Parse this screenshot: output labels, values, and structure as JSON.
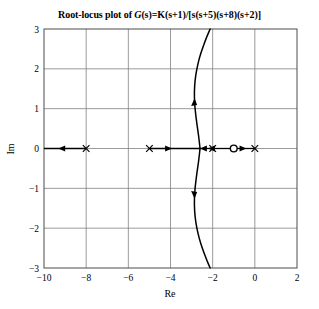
{
  "figure": {
    "title_prefix": "Root-locus plot of ",
    "title_expr_g": "G",
    "title_expr_s1": "(s)",
    "title_expr_eq": "=K",
    "title_expr_rest": "(s+1)/[s(s+5)(s+8)(s+2)]",
    "title_full": "Root-locus plot of G(s)=K(s+1)/[s(s+5)(s+8)(s+2)]"
  },
  "chart_data": {
    "type": "line",
    "title": "Root-locus plot of G(s)=K(s+1)/[s(s+5)(s+8)(s+2)]",
    "xlabel": "Re",
    "ylabel": "Im",
    "xlim": [
      -10,
      2
    ],
    "ylim": [
      -3,
      3
    ],
    "grid": true,
    "legend": "none",
    "xticks": [
      -10,
      -8,
      -6,
      -4,
      -2,
      0,
      2
    ],
    "xtick_labels": [
      "−10",
      "−8",
      "−6",
      "−4",
      "−2",
      "0",
      "2"
    ],
    "yticks": [
      -3,
      -2,
      -1,
      0,
      1,
      2,
      3
    ],
    "ytick_labels": [
      "−3",
      "−2",
      "−1",
      "0",
      "1",
      "2",
      "3"
    ],
    "poles": [
      {
        "marker": "x",
        "re": -8,
        "im": 0
      },
      {
        "marker": "x",
        "re": -5,
        "im": 0
      },
      {
        "marker": "x",
        "re": -2,
        "im": 0
      },
      {
        "marker": "x",
        "re": 0,
        "im": 0
      }
    ],
    "zeros": [
      {
        "marker": "o",
        "re": -1,
        "im": 0
      }
    ],
    "real_axis_segments": [
      {
        "from": -10,
        "to": -8,
        "arrow_at": -9.1,
        "arrow_dir": "left"
      },
      {
        "from": -5,
        "to": -2.6,
        "arrow_at": -4.15,
        "arrow_dir": "right"
      },
      {
        "from": -2.6,
        "to": -2,
        "arrow_at": -2.38,
        "arrow_dir": "left"
      },
      {
        "from": -2,
        "to": -1,
        "arrow_at": -2.0,
        "arrow_dir": "left"
      },
      {
        "from": -1,
        "to": 0,
        "arrow_at": -0.62,
        "arrow_dir": "right"
      }
    ],
    "breakaway_point": {
      "re": -2.6,
      "im": 0
    },
    "branches": [
      {
        "name": "upper-complex-branch",
        "points": [
          [
            -2.6,
            0.0
          ],
          [
            -2.66,
            0.3
          ],
          [
            -2.75,
            0.62
          ],
          [
            -2.82,
            0.92
          ],
          [
            -2.86,
            1.16
          ],
          [
            -2.87,
            1.42
          ],
          [
            -2.84,
            1.7
          ],
          [
            -2.76,
            1.98
          ],
          [
            -2.64,
            2.26
          ],
          [
            -2.48,
            2.52
          ],
          [
            -2.3,
            2.78
          ],
          [
            -2.12,
            3.0
          ]
        ],
        "arrow_at": [
          -2.86,
          1.15
        ],
        "arrow_dir": "up"
      },
      {
        "name": "lower-complex-branch",
        "points": [
          [
            -2.6,
            0.0
          ],
          [
            -2.66,
            -0.3
          ],
          [
            -2.75,
            -0.62
          ],
          [
            -2.82,
            -0.92
          ],
          [
            -2.86,
            -1.16
          ],
          [
            -2.87,
            -1.42
          ],
          [
            -2.84,
            -1.7
          ],
          [
            -2.76,
            -1.98
          ],
          [
            -2.64,
            -2.26
          ],
          [
            -2.48,
            -2.52
          ],
          [
            -2.3,
            -2.78
          ],
          [
            -2.12,
            -3.0
          ]
        ],
        "arrow_at": [
          -2.86,
          -1.15
        ],
        "arrow_dir": "down"
      }
    ],
    "colors": {
      "locus": "#000000",
      "grid": "#808080",
      "frame": "#4d4d4d",
      "background": "#ffffff"
    }
  }
}
